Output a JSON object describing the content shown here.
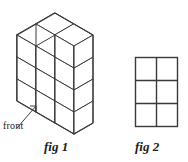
{
  "figure": {
    "background_color": "#ffffff",
    "stroke_color": "#3a3a3a",
    "text_color": "#1a1a1a",
    "annotation": {
      "front_label": "front",
      "leader_line": "arrow pointing up-right from label to front-left bottom cube face"
    },
    "captions": {
      "fig1": "fig 1",
      "fig2": "fig 2"
    },
    "fig1": {
      "name": "isometric-cube-stack",
      "description": "Stepped stack of unit cubes drawn in isometric projection",
      "columns": [
        {
          "position": "left",
          "height_in_cubes": 3
        },
        {
          "position": "right",
          "height_in_cubes": 2
        }
      ],
      "depth_in_cubes": 2,
      "width_in_cubes": 2,
      "visible_cube_count": 10
    },
    "fig2": {
      "name": "rectangle-grid",
      "description": "Flat rectangle divided into a grid of equal cells",
      "columns": 2,
      "rows": 3,
      "cell_count": 6,
      "bounds": {
        "x": 135,
        "y": 57,
        "width": 43,
        "height": 70
      }
    }
  }
}
